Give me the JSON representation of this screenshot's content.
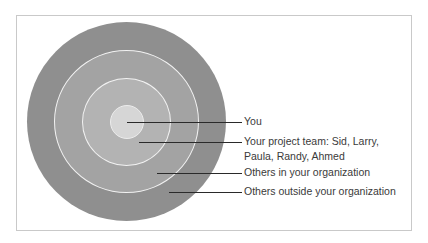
{
  "diagram": {
    "type": "concentric-circles",
    "colors": {
      "outer": "#8f8f8f",
      "organization": "#a3a3a3",
      "team": "#b3b3b3",
      "you": "#d6d6d6",
      "ring_border": "#f2f2f2",
      "leader": "#2a2a2a"
    },
    "labels": [
      {
        "line1": "You",
        "line2": ""
      },
      {
        "line1": "Your project team: Sid, Larry,",
        "line2": "Paula, Randy, Ahmed"
      },
      {
        "line1": "Others in your organization",
        "line2": ""
      },
      {
        "line1": "Others outside your organization",
        "line2": ""
      }
    ]
  }
}
